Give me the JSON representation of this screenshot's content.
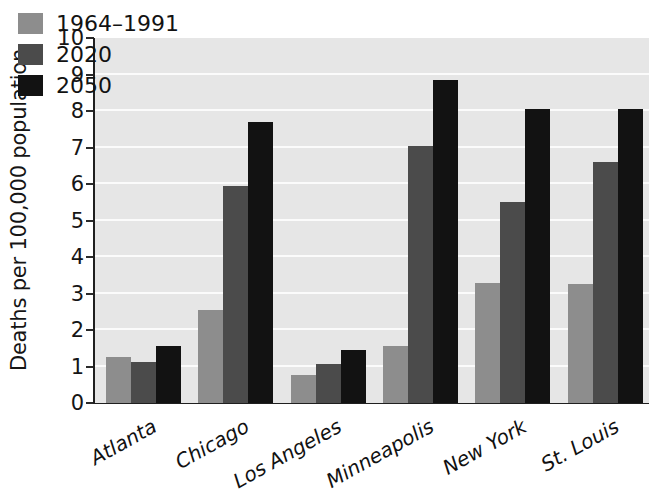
{
  "chart_data": {
    "type": "bar",
    "title": "",
    "subtitle": "",
    "xlabel": "",
    "ylabel": "Deaths per 100,000 population",
    "categories": [
      "Atlanta",
      "Chicago",
      "Los Angeles",
      "Minneapolis",
      "New York",
      "St. Louis"
    ],
    "series": [
      {
        "name": "1964–1991",
        "color": "#8d8d8d",
        "values": [
          1.25,
          2.55,
          0.78,
          1.55,
          3.3,
          3.25
        ]
      },
      {
        "name": "2020",
        "color": "#4b4b4b",
        "values": [
          1.12,
          5.95,
          1.08,
          7.05,
          5.5,
          6.6
        ]
      },
      {
        "name": "2050",
        "color": "#121212",
        "values": [
          1.57,
          7.7,
          1.45,
          8.85,
          8.05,
          8.05
        ]
      }
    ],
    "ylim": [
      0,
      10
    ],
    "ytick_labels": [
      "0",
      "1",
      "2",
      "3",
      "4",
      "5",
      "6",
      "7",
      "8",
      "9",
      "10"
    ],
    "ytick_values": [
      0,
      1,
      2,
      3,
      4,
      5,
      6,
      7,
      8,
      9,
      10
    ],
    "grid": true,
    "grid_axis": "y",
    "grid_color": "#fbfbfb",
    "plot_background": "#e6e6e6",
    "figure_background": "#ffffff",
    "legend_position": "upper-left-inside",
    "legend_entries": [
      "1964–1991",
      "2020",
      "2050"
    ],
    "xtick_rotation_degrees": -29,
    "xtick_style": "italic"
  }
}
